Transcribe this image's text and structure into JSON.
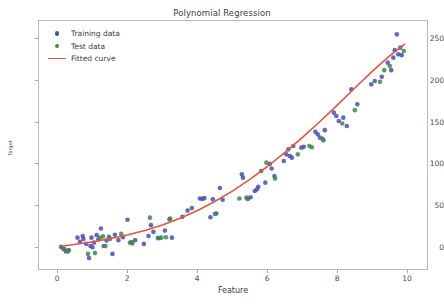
{
  "chart_data": {
    "type": "scatter",
    "title": "Polynomial Regression",
    "xlabel": "Feature",
    "ylabel": "Target",
    "xlim": [
      -0.55,
      10.6
    ],
    "ylim": [
      -28,
      272
    ],
    "xticks": [
      0,
      2,
      4,
      6,
      8,
      10
    ],
    "yticks": [
      0,
      50,
      100,
      150,
      200,
      250
    ],
    "grid": false,
    "legend_position": "upper left",
    "colors": {
      "training": "#4a4fb0",
      "test": "#3a8a4a",
      "fitted": "#e8533a",
      "axis": "#b9b9b9",
      "text": "#3d3d3d"
    },
    "series": [
      {
        "name": "Training data",
        "type": "scatter",
        "color": "#4a4fb0",
        "points": [
          [
            0.08,
            1.0
          ],
          [
            0.15,
            -1.5
          ],
          [
            0.22,
            -4.5
          ],
          [
            0.3,
            -3.0
          ],
          [
            0.55,
            12.0
          ],
          [
            0.62,
            7.0
          ],
          [
            0.7,
            14.0
          ],
          [
            0.72,
            10.5
          ],
          [
            0.8,
            4.5
          ],
          [
            0.88,
            -12.5
          ],
          [
            0.92,
            2.0
          ],
          [
            0.95,
            12.0
          ],
          [
            0.98,
            0.5
          ],
          [
            1.02,
            6.0
          ],
          [
            1.1,
            15.0
          ],
          [
            1.15,
            10.0
          ],
          [
            1.22,
            23.0
          ],
          [
            1.3,
            2.0
          ],
          [
            1.38,
            8.5
          ],
          [
            1.45,
            13.0
          ],
          [
            1.55,
            -7.5
          ],
          [
            1.62,
            15.5
          ],
          [
            1.72,
            9.0
          ],
          [
            1.85,
            12.5
          ],
          [
            1.98,
            33.5
          ],
          [
            2.1,
            6.5
          ],
          [
            2.2,
            9.0
          ],
          [
            2.45,
            4.5
          ],
          [
            2.58,
            14.0
          ],
          [
            2.65,
            27.0
          ],
          [
            2.72,
            19.0
          ],
          [
            2.85,
            11.5
          ],
          [
            3.05,
            20.5
          ],
          [
            3.18,
            34.0
          ],
          [
            3.25,
            12.0
          ],
          [
            3.55,
            37.0
          ],
          [
            3.7,
            44.5
          ],
          [
            3.82,
            47.5
          ],
          [
            4.05,
            59.0
          ],
          [
            4.12,
            58.5
          ],
          [
            4.18,
            59.5
          ],
          [
            4.35,
            36.5
          ],
          [
            4.42,
            58.0
          ],
          [
            4.52,
            41.0
          ],
          [
            4.62,
            71.5
          ],
          [
            4.7,
            57.5
          ],
          [
            5.25,
            88.0
          ],
          [
            5.28,
            84.0
          ],
          [
            5.42,
            58.5
          ],
          [
            5.5,
            60.5
          ],
          [
            5.62,
            68.0
          ],
          [
            5.68,
            70.0
          ],
          [
            5.72,
            73.0
          ],
          [
            5.8,
            92.0
          ],
          [
            5.92,
            78.0
          ],
          [
            6.05,
            100.5
          ],
          [
            6.1,
            95.0
          ],
          [
            6.18,
            86.0
          ],
          [
            6.45,
            104.0
          ],
          [
            6.52,
            112.0
          ],
          [
            6.58,
            118.0
          ],
          [
            6.62,
            110.0
          ],
          [
            6.68,
            108.0
          ],
          [
            6.72,
            122.0
          ],
          [
            6.95,
            120.0
          ],
          [
            7.02,
            121.0
          ],
          [
            7.35,
            139.0
          ],
          [
            7.42,
            136.0
          ],
          [
            7.48,
            132.0
          ],
          [
            7.58,
            129.0
          ],
          [
            7.62,
            141.0
          ],
          [
            7.88,
            162.0
          ],
          [
            7.95,
            158.0
          ],
          [
            8.02,
            152.0
          ],
          [
            8.15,
            156.0
          ],
          [
            8.25,
            146.0
          ],
          [
            8.38,
            190.0
          ],
          [
            8.55,
            172.0
          ],
          [
            8.95,
            196.0
          ],
          [
            9.05,
            200.0
          ],
          [
            9.25,
            205.0
          ],
          [
            9.42,
            222.0
          ],
          [
            9.52,
            213.0
          ],
          [
            9.58,
            228.0
          ],
          [
            9.62,
            237.0
          ],
          [
            9.68,
            256.0
          ],
          [
            9.72,
            232.0
          ],
          [
            9.78,
            240.0
          ],
          [
            9.82,
            231.0
          ]
        ]
      },
      {
        "name": "Test data",
        "type": "scatter",
        "color": "#3a8a4a",
        "points": [
          [
            0.18,
            -2.0
          ],
          [
            0.28,
            -4.5
          ],
          [
            0.85,
            -7.5
          ],
          [
            1.05,
            -6.5
          ],
          [
            1.2,
            12.0
          ],
          [
            1.28,
            13.5
          ],
          [
            1.35,
            2.0
          ],
          [
            1.48,
            10.5
          ],
          [
            1.8,
            16.5
          ],
          [
            2.05,
            6.0
          ],
          [
            2.12,
            5.0
          ],
          [
            2.62,
            36.0
          ],
          [
            2.88,
            11.5
          ],
          [
            2.95,
            12.0
          ],
          [
            3.08,
            12.5
          ],
          [
            3.2,
            35.0
          ],
          [
            4.48,
            40.5
          ],
          [
            5.18,
            59.0
          ],
          [
            5.38,
            60.0
          ],
          [
            5.95,
            102.0
          ],
          [
            6.2,
            83.0
          ],
          [
            6.85,
            112.0
          ],
          [
            7.18,
            122.0
          ],
          [
            7.25,
            120.5
          ],
          [
            7.55,
            131.0
          ],
          [
            8.12,
            149.0
          ],
          [
            8.48,
            165.0
          ],
          [
            9.2,
            199.0
          ],
          [
            9.32,
            213.0
          ],
          [
            9.48,
            218.0
          ],
          [
            9.88,
            236.0
          ]
        ]
      }
    ],
    "fitted_curve": {
      "name": "Fitted curve",
      "color": "#e8533a",
      "points": [
        [
          0.05,
          1.5
        ],
        [
          0.5,
          4.0
        ],
        [
          1.0,
          7.0
        ],
        [
          1.5,
          11.0
        ],
        [
          2.0,
          15.5
        ],
        [
          2.5,
          21.0
        ],
        [
          3.0,
          27.5
        ],
        [
          3.5,
          35.5
        ],
        [
          4.0,
          45.0
        ],
        [
          4.5,
          56.0
        ],
        [
          5.0,
          68.5
        ],
        [
          5.5,
          82.5
        ],
        [
          6.0,
          98.0
        ],
        [
          6.5,
          115.0
        ],
        [
          7.0,
          133.0
        ],
        [
          7.5,
          152.0
        ],
        [
          8.0,
          172.0
        ],
        [
          8.5,
          192.5
        ],
        [
          9.0,
          212.5
        ],
        [
          9.5,
          231.0
        ],
        [
          9.9,
          244.0
        ]
      ]
    }
  },
  "legend": {
    "items": [
      {
        "label": "Training data",
        "marker": "dot",
        "color": "#4a4fb0"
      },
      {
        "label": "Test data",
        "marker": "dot",
        "color": "#3a8a4a"
      },
      {
        "label": "Fitted curve",
        "marker": "line",
        "color": "#e8533a"
      }
    ]
  }
}
